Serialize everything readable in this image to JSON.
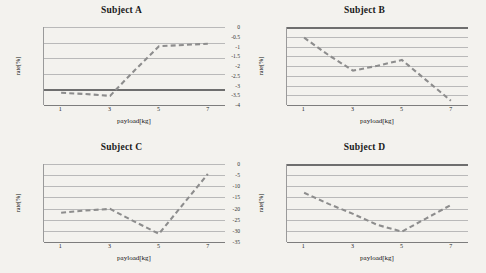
{
  "page": {
    "background_color": "#f3f2ee",
    "series_color": "#8d8d8d",
    "gridline_color": "#b9b9b9",
    "axis_color": "#6e6e6e"
  },
  "charts": [
    {
      "title": "Subject A",
      "xlabel": "payload[kg]",
      "ylabel": "rate[%]",
      "xticks": [
        "1",
        "3",
        "5",
        "7"
      ],
      "yticks": [
        "200",
        "150",
        "100",
        "50",
        "0",
        "-50"
      ],
      "chart_data": {
        "type": "line",
        "title": "Subject A",
        "xlabel": "payload[kg]",
        "ylabel": "rate[%]",
        "x": [
          1,
          2,
          3,
          4,
          5,
          6,
          7
        ],
        "values": [
          -12,
          -16,
          -22,
          60,
          138,
          142,
          146
        ],
        "xlim": [
          0.3,
          7.7
        ],
        "ylim": [
          -50,
          200
        ],
        "ytick_values": [
          200,
          150,
          100,
          50,
          0,
          -50
        ],
        "xtick_values": [
          1,
          3,
          5,
          7
        ],
        "grid": true,
        "legend": "none",
        "zero_line": 0
      }
    },
    {
      "title": "Subject B",
      "xlabel": "payload[kg]",
      "ylabel": "rate[%]",
      "xticks": [
        "1",
        "3",
        "5",
        "7"
      ],
      "yticks": [
        "0",
        "-0.5",
        "-1",
        "-1.5",
        "-2",
        "-2.5",
        "-3",
        "-3.5",
        "-4"
      ],
      "chart_data": {
        "type": "line",
        "title": "Subject B",
        "xlabel": "payload[kg]",
        "ylabel": "rate[%]",
        "x": [
          1,
          2,
          3,
          4,
          5,
          6,
          7
        ],
        "values": [
          -0.55,
          -1.45,
          -2.25,
          -2.0,
          -1.7,
          -2.75,
          -3.8
        ],
        "xlim": [
          0.3,
          7.7
        ],
        "ylim": [
          -4,
          0
        ],
        "ytick_values": [
          0,
          -0.5,
          -1,
          -1.5,
          -2,
          -2.5,
          -3,
          -3.5,
          -4
        ],
        "xtick_values": [
          1,
          3,
          5,
          7
        ],
        "grid": true,
        "legend": "none",
        "zero_line": 0
      }
    },
    {
      "title": "Subject C",
      "xlabel": "payload[kg]",
      "ylabel": "rate[%]",
      "xticks": [
        "1",
        "3",
        "5",
        "7"
      ],
      "yticks": [
        "70",
        "60",
        "50",
        "40",
        "30",
        "20",
        "10",
        "0"
      ],
      "chart_data": {
        "type": "line",
        "title": "Subject C",
        "xlabel": "payload[kg]",
        "ylabel": "rate[%]",
        "x": [
          1,
          2,
          3,
          4,
          5,
          6,
          7
        ],
        "values": [
          26,
          28,
          29.5,
          18,
          7,
          34,
          61
        ],
        "xlim": [
          0.3,
          7.7
        ],
        "ylim": [
          0,
          70
        ],
        "ytick_values": [
          70,
          60,
          50,
          40,
          30,
          20,
          10,
          0
        ],
        "xtick_values": [
          1,
          3,
          5,
          7
        ],
        "grid": true,
        "legend": "none",
        "zero_line": 0
      }
    },
    {
      "title": "Subject D",
      "xlabel": "payload[kg]",
      "ylabel": "rate[%]",
      "xticks": [
        "1",
        "3",
        "5",
        "7"
      ],
      "yticks": [
        "0",
        "-5",
        "-10",
        "-15",
        "-20",
        "-25",
        "-30",
        "-35"
      ],
      "chart_data": {
        "type": "line",
        "title": "Subject D",
        "xlabel": "payload[kg]",
        "ylabel": "rate[%]",
        "x": [
          1,
          2,
          3,
          4,
          5,
          6,
          7
        ],
        "values": [
          -13,
          -18,
          -22.5,
          -27.5,
          -30.5,
          -24.5,
          -18.5
        ],
        "xlim": [
          0.3,
          7.7
        ],
        "ylim": [
          -35,
          0
        ],
        "ytick_values": [
          0,
          -5,
          -10,
          -15,
          -20,
          -25,
          -30,
          -35
        ],
        "xtick_values": [
          1,
          3,
          5,
          7
        ],
        "grid": true,
        "legend": "none",
        "zero_line": 0
      }
    }
  ]
}
